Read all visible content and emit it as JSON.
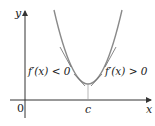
{
  "figure": {
    "axis_labels": {
      "y": "y",
      "x": "x"
    },
    "origin_label": "0",
    "critical_point_label": "c",
    "left_annotation": "f′(x) < 0",
    "right_annotation": "f′(x) > 0"
  },
  "colors": {
    "curve": "#8a8a8a",
    "tangent": "#555555",
    "axis": "#333333",
    "text": "#222222"
  }
}
